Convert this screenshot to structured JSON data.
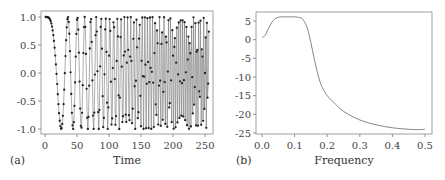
{
  "chart_data": [
    {
      "panel": "(a)",
      "type": "line",
      "title": "",
      "xlabel": "Time",
      "ylabel": "",
      "xlim": [
        0,
        256
      ],
      "ylim": [
        -1.0,
        1.0
      ],
      "xticks": [
        "0",
        "50",
        "100",
        "150",
        "200",
        "250"
      ],
      "yticks": [
        "1.0",
        "0.5",
        "0.0",
        "-0.5",
        "-1.0"
      ],
      "markers": true,
      "description": "Chirp signal: cosine whose frequency increases linearly with time, sampled at integer time steps",
      "model": {
        "form": "cos(2*pi*k*t^2)",
        "k": 0.00078
      },
      "x": [
        0,
        10,
        20,
        25,
        30,
        40,
        42,
        50,
        53,
        60,
        67,
        70,
        75,
        80,
        85,
        90,
        95,
        100,
        150,
        200,
        250,
        256
      ],
      "values": [
        1.0,
        0.92,
        0.05,
        -1.0,
        -0.2,
        0.95,
        1.0,
        -0.3,
        -1.0,
        0.1,
        1.0,
        0.5,
        -0.9,
        0.2,
        1.0,
        -0.5,
        -0.8,
        0.9,
        0.3,
        0.2,
        -0.9,
        0.62
      ],
      "grid": false
    },
    {
      "panel": "(b)",
      "type": "line",
      "title": "",
      "xlabel": "Frequency",
      "ylabel": "",
      "xlim": [
        0.0,
        0.5
      ],
      "ylim": [
        -25,
        6
      ],
      "xticks": [
        "0.0",
        "0.1",
        "0.2",
        "0.3",
        "0.4",
        "0.5"
      ],
      "yticks": [
        "5",
        "0",
        "-5",
        "-10",
        "-15",
        "-20",
        "-25"
      ],
      "x": [
        0.0,
        0.01,
        0.02,
        0.03,
        0.04,
        0.05,
        0.06,
        0.08,
        0.1,
        0.12,
        0.13,
        0.14,
        0.15,
        0.16,
        0.17,
        0.18,
        0.19,
        0.2,
        0.22,
        0.25,
        0.3,
        0.35,
        0.4,
        0.45,
        0.48,
        0.5
      ],
      "values": [
        0.5,
        1.2,
        3.0,
        4.6,
        5.6,
        6.0,
        6.1,
        6.1,
        6.1,
        5.8,
        4.8,
        2.8,
        -0.8,
        -5.0,
        -8.8,
        -11.8,
        -13.6,
        -15.0,
        -16.8,
        -19.2,
        -21.5,
        -22.8,
        -23.6,
        -24.0,
        -24.1,
        -24.0
      ],
      "grid": false
    }
  ]
}
